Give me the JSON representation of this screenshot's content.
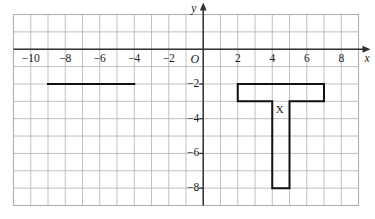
{
  "figure": {
    "type": "coordinate-grid",
    "width": 375,
    "height": 219,
    "background_color": "#ffffff"
  },
  "axes": {
    "x_axis_label": "x",
    "y_axis_label": "y",
    "origin_label": "O",
    "axis_color": "#333333",
    "grid_color": "#b0b0b0",
    "x_ticks": [
      {
        "value": -10,
        "label": "−10"
      },
      {
        "value": -8,
        "label": "−8"
      },
      {
        "value": -6,
        "label": "−6"
      },
      {
        "value": -4,
        "label": "−4"
      },
      {
        "value": -2,
        "label": "−2"
      },
      {
        "value": 2,
        "label": "2"
      },
      {
        "value": 4,
        "label": "4"
      },
      {
        "value": 6,
        "label": "6"
      },
      {
        "value": 8,
        "label": "8"
      }
    ],
    "y_ticks": [
      {
        "value": -2,
        "label": "−2"
      },
      {
        "value": -4,
        "label": "−4"
      },
      {
        "value": -6,
        "label": "−6"
      },
      {
        "value": -8,
        "label": "−8"
      }
    ],
    "x_range": [
      -11,
      9
    ],
    "y_range": [
      -9,
      2
    ],
    "x_gridlines_every": 1,
    "y_gridlines_every": 1
  },
  "shapes": {
    "t_shape": {
      "label": "X",
      "label_position": {
        "x": 4.2,
        "y": -3.45
      },
      "stroke_color": "#111111",
      "stroke_width": 2,
      "fill": "none",
      "points": [
        {
          "x": 2,
          "y": -2
        },
        {
          "x": 7,
          "y": -2
        },
        {
          "x": 7,
          "y": -3
        },
        {
          "x": 5,
          "y": -3
        },
        {
          "x": 5,
          "y": -8
        },
        {
          "x": 4,
          "y": -8
        },
        {
          "x": 4,
          "y": -3
        },
        {
          "x": 2,
          "y": -3
        }
      ]
    },
    "segment": {
      "stroke_color": "#111111",
      "stroke_width": 2,
      "start": {
        "x": -9,
        "y": -2
      },
      "end": {
        "x": -4,
        "y": -2
      }
    }
  },
  "chart_data": {
    "type": "scatter",
    "title": "",
    "xlabel": "x",
    "ylabel": "y",
    "xlim": [
      -11,
      9
    ],
    "ylim": [
      -9,
      2
    ],
    "grid": true,
    "legend": "none",
    "xticks": [
      -10,
      -8,
      -6,
      -4,
      -2,
      0,
      2,
      4,
      6,
      8
    ],
    "yticks": [
      -2,
      -4,
      -6,
      -8
    ],
    "annotations": [
      {
        "name": "t-shape",
        "label": "X",
        "kind": "polygon",
        "vertices": [
          [
            2,
            -2
          ],
          [
            7,
            -2
          ],
          [
            7,
            -3
          ],
          [
            5,
            -3
          ],
          [
            5,
            -8
          ],
          [
            4,
            -8
          ],
          [
            4,
            -3
          ],
          [
            2,
            -3
          ]
        ]
      },
      {
        "name": "horizontal-segment",
        "kind": "line",
        "vertices": [
          [
            -9,
            -2
          ],
          [
            -4,
            -2
          ]
        ]
      }
    ]
  }
}
